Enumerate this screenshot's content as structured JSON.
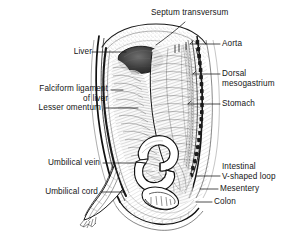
{
  "figure": {
    "background_color": "#ffffff",
    "ink_color": "#151515",
    "style": "pen-and-ink anatomical line drawing with stipple and hatch shading"
  },
  "labels": {
    "septum_transversum": "Septum transversum",
    "aorta": "Aorta",
    "liver": "Liver",
    "dorsal": "Dorsal",
    "mesogastrium": "mesogastrium",
    "falciform_ligament": "Falciform ligament",
    "of_liver": "of liver",
    "stomach": "Stomach",
    "lesser_omentum": "Lesser omentum",
    "umbilical_vein": "Umbilical vein",
    "intestinal": "Intestinal",
    "v_shaped_loop": "V-shaped loop",
    "umbilical_cord": "Umbilical cord",
    "mesentery": "Mesentery",
    "colon": "Colon"
  },
  "label_list": [
    {
      "key": "septum_transversum",
      "text": "Septum transversum",
      "side": "top"
    },
    {
      "key": "aorta",
      "text": "Aorta",
      "side": "right"
    },
    {
      "key": "liver",
      "text": "Liver",
      "side": "left"
    },
    {
      "key": "dorsal_mesogastrium",
      "text": "Dorsal mesogastrium",
      "side": "right"
    },
    {
      "key": "falciform_ligament_of_liver",
      "text": "Falciform ligament of liver",
      "side": "left"
    },
    {
      "key": "stomach",
      "text": "Stomach",
      "side": "right"
    },
    {
      "key": "lesser_omentum",
      "text": "Lesser omentum",
      "side": "left"
    },
    {
      "key": "umbilical_vein",
      "text": "Umbilical vein",
      "side": "left"
    },
    {
      "key": "intestinal_v_shaped_loop",
      "text": "Intestinal V-shaped loop",
      "side": "right"
    },
    {
      "key": "umbilical_cord",
      "text": "Umbilical cord",
      "side": "left"
    },
    {
      "key": "mesentery",
      "text": "Mesentery",
      "side": "right"
    },
    {
      "key": "colon",
      "text": "Colon",
      "side": "right"
    }
  ]
}
